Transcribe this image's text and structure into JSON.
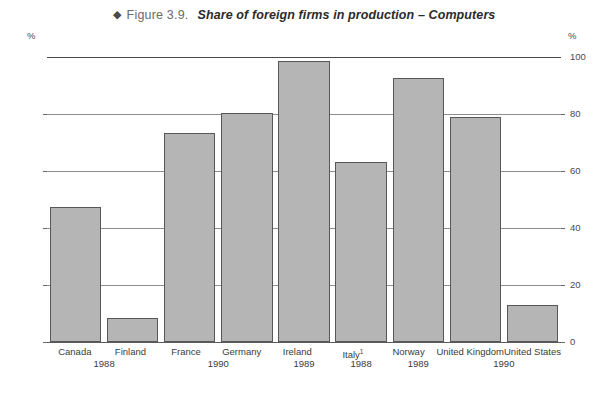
{
  "title": {
    "marker": "◆",
    "figure_number": "Figure 3.9.",
    "text": "Share of foreign firms in production – Computers"
  },
  "axis": {
    "unit_left": "%",
    "unit_right": "%",
    "ticks": [
      "100",
      "80",
      "60",
      "40",
      "20",
      "0"
    ]
  },
  "chart_data": {
    "type": "bar",
    "title": "Share of foreign firms in production – Computers",
    "xlabel": "",
    "ylabel": "%",
    "ylim": [
      0,
      100
    ],
    "yticks": [
      0,
      20,
      40,
      60,
      80,
      100
    ],
    "grid": true,
    "legend": "none",
    "bar_color": "#b5b5b5",
    "bar_edge_color": "#575757",
    "categories": [
      "Canada",
      "Finland",
      "France",
      "Germany",
      "Ireland",
      "Italy",
      "Norway",
      "United Kingdom",
      "United States"
    ],
    "category_labels": [
      "Canada",
      "Finland",
      "France",
      "Germany",
      "Ireland",
      "Italy¹",
      "Norway",
      "United Kingdom",
      "United States"
    ],
    "values": [
      47.5,
      8.5,
      73.5,
      80.5,
      98.5,
      63,
      92.5,
      79,
      13
    ],
    "years": [
      {
        "label": "1988",
        "categories": [
          "Canada",
          "Finland"
        ]
      },
      {
        "label": "1990",
        "categories": [
          "France",
          "Germany"
        ]
      },
      {
        "label": "1989",
        "categories": [
          "Ireland"
        ]
      },
      {
        "label": "1988",
        "categories": [
          "Italy"
        ]
      },
      {
        "label": "1989",
        "categories": [
          "Norway"
        ]
      },
      {
        "label": "1990",
        "categories": [
          "United Kingdom",
          "United States"
        ]
      }
    ],
    "footnote_marker": "1"
  }
}
